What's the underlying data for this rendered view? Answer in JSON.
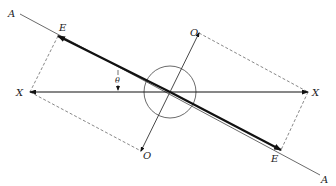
{
  "diagram": {
    "labels": {
      "A_top": "A",
      "A_bottom": "A",
      "E_top": "E",
      "E_bottom": "E",
      "X_left": "X",
      "X_right": "X",
      "O_top": "O",
      "O_bottom": "O",
      "theta": "θ"
    },
    "colors": {
      "stroke": "#222222",
      "background": "#ffffff"
    }
  }
}
